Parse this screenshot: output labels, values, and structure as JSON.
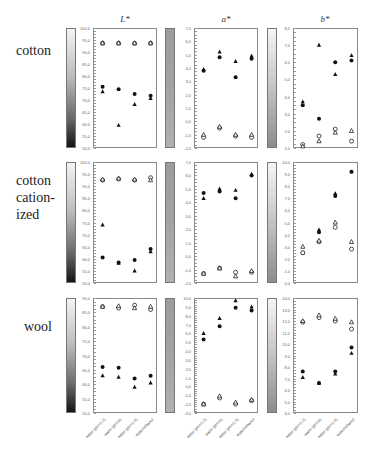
{
  "chart_data": {
    "type": "scatter",
    "layout": "3x3 grid of panels (rows: substrate, columns: colour coordinate)",
    "columns": [
      "L*",
      "a*",
      "b*"
    ],
    "rows": [
      "cotton",
      "cotton cationized",
      "wool"
    ],
    "categories": [
      "water (pH=2.2)",
      "water (pH=6)",
      "water (pH=2.4)",
      "water/ethanol"
    ],
    "marker_legend": [
      "filled circle",
      "filled triangle",
      "open circle",
      "open triangle"
    ],
    "panels": [
      {
        "row": "cotton",
        "column": "L*",
        "ylim": [
          50,
          100
        ],
        "yticks": [
          "100,0",
          "95,0",
          "90,0",
          "85,0",
          "80,0",
          "75,0",
          "70,0",
          "65,0",
          "60,0",
          "55,0",
          "50,0"
        ],
        "series": [
          {
            "name": "filled circle",
            "values": [
              75.5,
              74.5,
              72.5,
              71.8
            ]
          },
          {
            "name": "filled triangle",
            "values": [
              73.5,
              59.5,
              68.2,
              70.7
            ]
          },
          {
            "name": "open circle",
            "values": [
              93.7,
              93.7,
              93.6,
              93.7
            ]
          },
          {
            "name": "open triangle",
            "values": [
              93.7,
              93.7,
              93.7,
              93.7
            ]
          }
        ]
      },
      {
        "row": "cotton",
        "column": "a*",
        "ylim": [
          -2,
          7
        ],
        "yticks": [
          "7,0",
          "6,0",
          "5,0",
          "4,0",
          "3,0",
          "2,0",
          "1,0",
          "0,0",
          "-1,0",
          "-2,0"
        ],
        "series": [
          {
            "name": "filled circle",
            "values": [
              3.8,
              4.8,
              3.3,
              4.7
            ]
          },
          {
            "name": "filled triangle",
            "values": [
              3.9,
              5.2,
              4.5,
              4.9
            ]
          },
          {
            "name": "open circle",
            "values": [
              -1.2,
              -0.5,
              -1.1,
              -1.2
            ]
          },
          {
            "name": "open triangle",
            "values": [
              -1.0,
              -0.4,
              -1.0,
              -1.0
            ]
          }
        ]
      },
      {
        "row": "cotton",
        "column": "b*",
        "ylim": [
          1,
          8
        ],
        "yticks": [
          "8,0",
          "7,0",
          "6,0",
          "5,0",
          "4,0",
          "3,0",
          "2,0",
          "1,0"
        ],
        "series": [
          {
            "name": "filled circle",
            "values": [
              3.5,
              2.7,
              6.0,
              6.1
            ]
          },
          {
            "name": "filled triangle",
            "values": [
              3.7,
              7.0,
              5.3,
              6.4
            ]
          },
          {
            "name": "open circle",
            "values": [
              1.2,
              1.7,
              2.1,
              1.4
            ]
          },
          {
            "name": "open triangle",
            "values": [
              1.1,
              1.4,
              1.9,
              2.0
            ]
          }
        ]
      },
      {
        "row": "cotton cationized",
        "column": "L*",
        "ylim": [
          50,
          100
        ],
        "yticks": [
          "100,0",
          "95,0",
          "90,0",
          "85,0",
          "80,0",
          "75,0",
          "70,0",
          "65,0",
          "60,0",
          "55,0",
          "50,0"
        ],
        "series": [
          {
            "name": "filled circle",
            "values": [
              60.5,
              58.5,
              59.5,
              64.0
            ]
          },
          {
            "name": "filled triangle",
            "values": [
              74.0,
              58.2,
              55.0,
              63.0
            ]
          },
          {
            "name": "open circle",
            "values": [
              92.5,
              93.0,
              92.5,
              93.5
            ]
          },
          {
            "name": "open triangle",
            "values": [
              92.8,
              93.2,
              92.8,
              92.5
            ]
          }
        ]
      },
      {
        "row": "cotton cationized",
        "column": "a*",
        "ylim": [
          -2,
          7
        ],
        "yticks": [
          "7,0",
          "6,0",
          "5,0",
          "4,0",
          "3,0",
          "2,0",
          "1,0",
          "0,0",
          "-1,0",
          "-2,0"
        ],
        "series": [
          {
            "name": "filled circle",
            "values": [
              4.7,
              4.8,
              4.3,
              6.0
            ]
          },
          {
            "name": "filled triangle",
            "values": [
              4.3,
              5.0,
              4.9,
              6.1
            ]
          },
          {
            "name": "open circle",
            "values": [
              -1.3,
              -0.9,
              -1.2,
              -1.2
            ]
          },
          {
            "name": "open triangle",
            "values": [
              -1.3,
              -0.9,
              -1.5,
              -1.1
            ]
          }
        ]
      },
      {
        "row": "cotton cationized",
        "column": "b*",
        "ylim": [
          0,
          10
        ],
        "yticks": [
          "10,0",
          "9,0",
          "8,0",
          "7,0",
          "6,0",
          "5,0",
          "4,0",
          "3,0",
          "2,0",
          "1,0",
          "0,0"
        ],
        "series": [
          {
            "name": "filled circle",
            "values": [
              2.5,
              4.2,
              7.2,
              9.2
            ]
          },
          {
            "name": "filled triangle",
            "values": [
              2.5,
              4.4,
              7.4,
              9.2
            ]
          },
          {
            "name": "open circle",
            "values": [
              2.5,
              3.4,
              4.6,
              2.8
            ]
          },
          {
            "name": "open triangle",
            "values": [
              3.0,
              3.5,
              5.0,
              3.4
            ]
          }
        ]
      },
      {
        "row": "wool",
        "column": "L*",
        "ylim": [
          50,
          90
        ],
        "yticks": [
          "90,0",
          "85,0",
          "80,0",
          "75,0",
          "70,0",
          "65,0",
          "60,0",
          "55,0",
          "50,0"
        ],
        "series": [
          {
            "name": "filled circle",
            "values": [
              66.0,
              65.7,
              62.0,
              63.0
            ]
          },
          {
            "name": "filled triangle",
            "values": [
              63.0,
              62.5,
              59.0,
              60.5
            ]
          },
          {
            "name": "open circle",
            "values": [
              87.0,
              86.5,
              87.5,
              86.0
            ]
          },
          {
            "name": "open triangle",
            "values": [
              87.0,
              87.2,
              86.5,
              87.0
            ]
          }
        ]
      },
      {
        "row": "wool",
        "column": "a*",
        "ylim": [
          -3,
          10
        ],
        "yticks": [
          "10,0",
          "9,0",
          "8,0",
          "7,0",
          "6,0",
          "5,0",
          "4,0",
          "3,0",
          "2,0",
          "1,0",
          "0,0",
          "-1,0",
          "-2,0",
          "-3,0"
        ],
        "series": [
          {
            "name": "filled circle",
            "values": [
              5.3,
              6.8,
              8.9,
              8.6
            ]
          },
          {
            "name": "filled triangle",
            "values": [
              6.0,
              7.7,
              9.7,
              9.0
            ]
          },
          {
            "name": "open circle",
            "values": [
              -2.0,
              -1.3,
              -2.0,
              -1.6
            ]
          },
          {
            "name": "open triangle",
            "values": [
              -2.0,
              -1.1,
              -1.8,
              -1.5
            ]
          }
        ]
      },
      {
        "row": "wool",
        "column": "b*",
        "ylim": [
          4,
          14
        ],
        "yticks": [
          "14,0",
          "13,0",
          "12,0",
          "11,0",
          "10,0",
          "9,0",
          "8,0",
          "7,0",
          "6,0",
          "5,0",
          "4,0"
        ],
        "series": [
          {
            "name": "filled circle",
            "values": [
              7.6,
              6.6,
              7.6,
              9.7
            ]
          },
          {
            "name": "filled triangle",
            "values": [
              7.1,
              6.6,
              7.4,
              9.2
            ]
          },
          {
            "name": "open circle",
            "values": [
              11.9,
              12.3,
              12.0,
              11.3
            ]
          },
          {
            "name": "open triangle",
            "values": [
              12.0,
              12.5,
              12.2,
              11.9
            ]
          }
        ]
      }
    ]
  },
  "labels": {
    "columns": [
      "L*",
      "a*",
      "b*"
    ],
    "rows": [
      [
        "cotton"
      ],
      [
        "cotton",
        "cation-",
        "ized"
      ],
      [
        "wool"
      ]
    ],
    "xticks": [
      "water (pH=2.2)",
      "water (pH=6)",
      "water (pH=2.4)",
      "water/ethanol"
    ]
  }
}
